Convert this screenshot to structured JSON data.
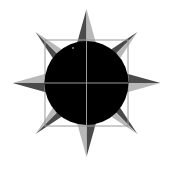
{
  "icon": {
    "name": "sun-icon",
    "canvas": {
      "width": 172,
      "height": 172,
      "background": "#ffffff"
    },
    "center": {
      "x": 86.5,
      "y": 83
    },
    "disc": {
      "radius": 42,
      "color": "#000000"
    },
    "guide_box": {
      "x": 45,
      "y": 40,
      "width": 83,
      "height": 86,
      "stroke": "#9a9a9a"
    },
    "crosshair": {
      "stroke": "#9a9a9a"
    },
    "highlight_dot": {
      "x": 73,
      "y": 48,
      "r": 1,
      "color": "#8a8a8a"
    },
    "colors": {
      "ray_dark": "#4a4a4a",
      "ray_light": "#b8b8b8"
    },
    "rays": {
      "cardinal": {
        "length": 74,
        "half_width": 10
      },
      "diagonal": {
        "length": 72,
        "half_width": 7
      },
      "count": 8
    }
  }
}
